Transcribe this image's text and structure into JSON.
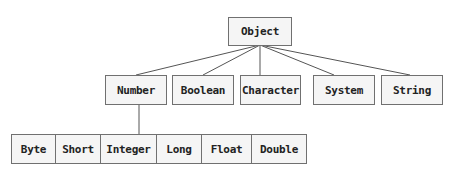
{
  "diagram": {
    "type": "class-hierarchy",
    "root": {
      "label": "Object"
    },
    "level1": [
      {
        "label": "Number"
      },
      {
        "label": "Boolean"
      },
      {
        "label": "Character"
      },
      {
        "label": "System"
      },
      {
        "label": "String"
      }
    ],
    "number_subclasses": [
      {
        "label": "Byte"
      },
      {
        "label": "Short"
      },
      {
        "label": "Integer"
      },
      {
        "label": "Long"
      },
      {
        "label": "Float"
      },
      {
        "label": "Double"
      }
    ],
    "edges": [
      {
        "from": "Object",
        "to": "Number"
      },
      {
        "from": "Object",
        "to": "Boolean"
      },
      {
        "from": "Object",
        "to": "Character"
      },
      {
        "from": "Object",
        "to": "System"
      },
      {
        "from": "Object",
        "to": "String"
      },
      {
        "from": "Number",
        "to": "Byte|Short|Integer|Long|Float|Double"
      }
    ],
    "colors": {
      "box_fill": "#f5f5f5",
      "box_border": "#707070",
      "edge": "#555555",
      "text": "#222222"
    }
  }
}
